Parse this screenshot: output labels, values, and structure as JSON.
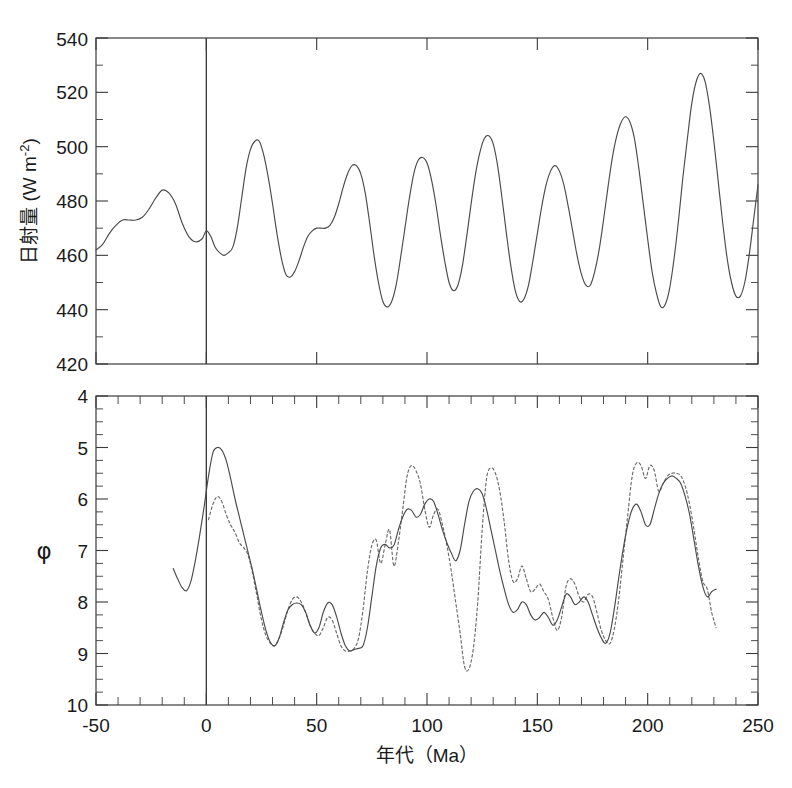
{
  "figure": {
    "background": "#ffffff",
    "ink_color": "#3a3a3a",
    "curve_color": "#4a4a4a",
    "dotted_color": "#6a6a6a"
  },
  "axis": {
    "x_label": "年代（Ma）",
    "x_ticks": [
      "-50",
      "0",
      "50",
      "100",
      "150",
      "200",
      "250"
    ],
    "top_y_label": "日射量 (W m",
    "top_y_label_sup": "-2",
    "top_y_label_tail": ")",
    "top_y_ticks": [
      "420",
      "440",
      "460",
      "480",
      "500",
      "520",
      "540"
    ],
    "bottom_y_label": "φ",
    "bottom_y_ticks": [
      "4",
      "5",
      "6",
      "7",
      "8",
      "9",
      "10"
    ]
  },
  "chart_data": [
    {
      "type": "line",
      "panel": "top",
      "title": "",
      "xlabel": "年代（Ma）",
      "ylabel": "日射量 (W m-2)",
      "xlim": [
        -50,
        250
      ],
      "ylim": [
        420,
        540
      ],
      "y_inverted": false,
      "grid": false,
      "legend": "none",
      "annotations": [
        {
          "type": "vertical-line",
          "x": 0
        }
      ],
      "series": [
        {
          "name": "insolation",
          "style": "solid",
          "x": [
            -50,
            -47,
            -44,
            -41,
            -38,
            -35,
            -32,
            -29,
            -26,
            -23,
            -20,
            -17,
            -14,
            -11,
            -8,
            -5,
            -2,
            0,
            2,
            4,
            6,
            8,
            10,
            12,
            14,
            16,
            18,
            20,
            22,
            24,
            26,
            28,
            30,
            32,
            34,
            36,
            38,
            40,
            42,
            44,
            46,
            48,
            50,
            52,
            54,
            56,
            58,
            60,
            62,
            64,
            66,
            68,
            70,
            72,
            74,
            76,
            78,
            80,
            82,
            84,
            86,
            88,
            90,
            92,
            94,
            96,
            98,
            100,
            102,
            104,
            106,
            108,
            110,
            112,
            114,
            116,
            118,
            120,
            122,
            124,
            126,
            128,
            130,
            132,
            134,
            136,
            138,
            140,
            142,
            144,
            146,
            148,
            150,
            152,
            154,
            156,
            158,
            160,
            162,
            164,
            166,
            168,
            170,
            172,
            174,
            176,
            178,
            180,
            182,
            184,
            186,
            188,
            190,
            192,
            194,
            196,
            198,
            200,
            202,
            204,
            206,
            208,
            210,
            212,
            214,
            216,
            218,
            220,
            222,
            224,
            226,
            228,
            230,
            232,
            234,
            236,
            238,
            240,
            242,
            244,
            246,
            248,
            250
          ],
          "y": [
            462,
            464,
            468,
            471,
            473,
            473,
            473,
            474,
            477,
            481,
            484,
            483,
            479,
            472,
            467,
            465,
            466,
            469,
            467,
            463,
            461,
            460,
            461,
            463,
            470,
            481,
            492,
            499,
            502,
            502,
            497,
            489,
            479,
            468,
            459,
            453,
            452,
            454,
            458,
            463,
            467,
            469,
            470,
            470,
            470,
            471,
            474,
            479,
            485,
            490,
            493,
            493,
            490,
            483,
            472,
            460,
            450,
            443,
            441,
            443,
            449,
            459,
            470,
            481,
            490,
            495,
            496,
            494,
            488,
            479,
            468,
            458,
            450,
            447,
            449,
            456,
            467,
            479,
            490,
            498,
            503,
            504,
            501,
            493,
            481,
            468,
            456,
            447,
            443,
            444,
            449,
            458,
            468,
            478,
            486,
            491,
            493,
            491,
            486,
            478,
            469,
            460,
            453,
            449,
            449,
            454,
            462,
            473,
            485,
            496,
            504,
            509,
            511,
            509,
            503,
            492,
            479,
            466,
            454,
            446,
            441,
            442,
            448,
            459,
            473,
            489,
            503,
            516,
            524,
            527,
            524,
            515,
            502,
            487,
            472,
            459,
            450,
            445,
            445,
            450,
            460,
            473,
            486,
            495,
            500,
            500,
            495,
            487,
            478,
            470
          ]
        }
      ]
    },
    {
      "type": "line",
      "panel": "bottom",
      "title": "",
      "xlabel": "年代（Ma）",
      "ylabel": "φ",
      "xlim": [
        -50,
        250
      ],
      "ylim": [
        4,
        10
      ],
      "y_inverted": true,
      "grid": false,
      "legend": "none",
      "annotations": [
        {
          "type": "vertical-line",
          "x": 0
        }
      ],
      "series": [
        {
          "name": "phi-solid",
          "style": "solid",
          "x": [
            -15,
            -13,
            -11,
            -9,
            -7,
            -5,
            -3,
            -1,
            1,
            3,
            5,
            7,
            9,
            11,
            13,
            15,
            17,
            19,
            21,
            23,
            25,
            27,
            29,
            31,
            33,
            35,
            37,
            39,
            41,
            43,
            45,
            47,
            49,
            51,
            53,
            55,
            57,
            59,
            61,
            63,
            65,
            67,
            69,
            71,
            73,
            75,
            77,
            79,
            81,
            83,
            85,
            87,
            89,
            91,
            93,
            95,
            97,
            99,
            101,
            103,
            105,
            107,
            109,
            111,
            113,
            115,
            117,
            119,
            121,
            123,
            125,
            127,
            129,
            131,
            133,
            135,
            137,
            139,
            141,
            143,
            145,
            147,
            149,
            151,
            153,
            155,
            157,
            159,
            161,
            163,
            165,
            167,
            169,
            171,
            173,
            175,
            177,
            179,
            181,
            183,
            185,
            187,
            189,
            191,
            193,
            195,
            197,
            199,
            201,
            203,
            205,
            207,
            209,
            211,
            213,
            215,
            217,
            219,
            221,
            223,
            225,
            227,
            229,
            231
          ],
          "y": [
            7.35,
            7.55,
            7.72,
            7.78,
            7.6,
            7.2,
            6.7,
            6.15,
            5.55,
            5.1,
            5.0,
            5.05,
            5.25,
            5.6,
            6.0,
            6.35,
            6.7,
            7.05,
            7.4,
            7.8,
            8.2,
            8.55,
            8.78,
            8.85,
            8.7,
            8.4,
            8.15,
            8.05,
            8.02,
            8.05,
            8.2,
            8.45,
            8.6,
            8.5,
            8.2,
            8.02,
            8.05,
            8.28,
            8.6,
            8.85,
            8.95,
            8.92,
            8.9,
            8.85,
            8.5,
            7.9,
            7.3,
            6.95,
            6.88,
            6.95,
            6.9,
            6.6,
            6.35,
            6.2,
            6.22,
            6.35,
            6.3,
            6.1,
            6.0,
            6.05,
            6.3,
            6.6,
            6.85,
            7.05,
            7.2,
            7.0,
            6.5,
            6.05,
            5.85,
            5.8,
            5.9,
            6.2,
            6.6,
            7.0,
            7.4,
            7.75,
            8.05,
            8.2,
            8.15,
            8.0,
            8.05,
            8.25,
            8.35,
            8.3,
            8.2,
            8.3,
            8.45,
            8.35,
            8.1,
            7.85,
            7.9,
            8.05,
            8.0,
            7.9,
            8.0,
            8.25,
            8.5,
            8.7,
            8.8,
            8.6,
            8.1,
            7.5,
            6.95,
            6.5,
            6.2,
            6.1,
            6.25,
            6.5,
            6.5,
            6.2,
            5.9,
            5.7,
            5.6,
            5.55,
            5.6,
            5.7,
            5.95,
            6.3,
            6.8,
            7.3,
            7.7,
            7.9,
            7.8,
            7.75
          ]
        },
        {
          "name": "phi-dotted",
          "style": "dotted",
          "x": [
            1,
            3,
            5,
            7,
            9,
            11,
            13,
            15,
            17,
            19,
            21,
            23,
            25,
            27,
            29,
            31,
            33,
            35,
            37,
            39,
            41,
            43,
            45,
            47,
            49,
            51,
            53,
            55,
            57,
            59,
            61,
            63,
            65,
            67,
            69,
            71,
            73,
            75,
            77,
            79,
            81,
            83,
            85,
            87,
            89,
            91,
            93,
            95,
            97,
            99,
            101,
            103,
            105,
            107,
            109,
            111,
            113,
            115,
            117,
            119,
            121,
            123,
            125,
            127,
            129,
            131,
            133,
            135,
            137,
            139,
            141,
            143,
            145,
            147,
            149,
            151,
            153,
            155,
            157,
            159,
            161,
            163,
            165,
            167,
            169,
            171,
            173,
            175,
            177,
            179,
            181,
            183,
            185,
            187,
            189,
            191,
            193,
            195,
            197,
            199,
            201,
            203,
            205,
            207,
            209,
            211,
            213,
            215,
            217,
            219,
            221,
            223,
            225,
            227,
            229,
            231
          ],
          "y": [
            6.4,
            6.1,
            5.95,
            6.05,
            6.3,
            6.5,
            6.65,
            6.85,
            6.95,
            7.1,
            7.45,
            7.9,
            8.35,
            8.65,
            8.8,
            8.85,
            8.7,
            8.45,
            8.15,
            7.95,
            7.9,
            8.0,
            8.2,
            8.45,
            8.6,
            8.65,
            8.5,
            8.3,
            8.35,
            8.6,
            8.85,
            8.95,
            8.95,
            8.9,
            8.7,
            8.15,
            7.4,
            6.9,
            6.8,
            7.25,
            6.9,
            6.6,
            7.3,
            6.85,
            6.2,
            5.55,
            5.35,
            5.45,
            5.7,
            6.2,
            6.55,
            6.3,
            6.2,
            6.5,
            6.9,
            7.4,
            8.0,
            8.6,
            9.25,
            9.3,
            8.9,
            8.0,
            6.6,
            5.6,
            5.4,
            5.5,
            5.85,
            6.45,
            7.2,
            7.6,
            7.55,
            7.3,
            7.55,
            7.8,
            7.75,
            7.65,
            7.8,
            7.95,
            8.3,
            8.55,
            8.3,
            7.7,
            7.55,
            7.65,
            7.9,
            8.0,
            7.85,
            7.9,
            8.2,
            8.55,
            8.75,
            8.8,
            8.5,
            7.9,
            7.1,
            6.3,
            5.55,
            5.3,
            5.35,
            5.6,
            5.35,
            5.45,
            5.85,
            5.7,
            5.55,
            5.5,
            5.5,
            5.55,
            5.75,
            6.1,
            6.6,
            7.15,
            7.6,
            7.75,
            8.2,
            8.5
          ]
        }
      ]
    }
  ]
}
